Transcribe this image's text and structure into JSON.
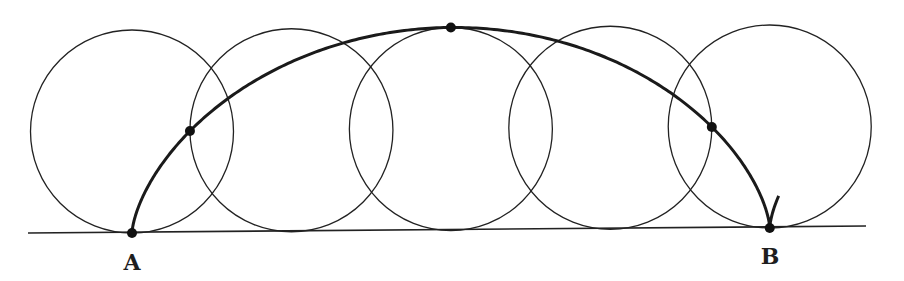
{
  "diagram": {
    "colors": {
      "background": "#ffffff",
      "stroke": "#222222",
      "curve": "#1a1a1a",
      "point": "#111111"
    },
    "ground_line": {
      "x1": 28,
      "y1": 233,
      "x2": 866,
      "y2": 226,
      "stroke_width": 1.6
    },
    "rolling_circle": {
      "radius": 101.5,
      "start_x": 132,
      "base_y": 233,
      "tilt_per_px": -0.00784
    },
    "circles": [
      {
        "t": 0.0
      },
      {
        "t": 1.5708
      },
      {
        "t": 3.1416
      },
      {
        "t": 4.7124
      },
      {
        "t": 6.2832
      }
    ],
    "cycloid": {
      "t_start": 0,
      "t_end": 7.1,
      "stroke_width": 3
    },
    "points": [
      {
        "name": "point-A",
        "t": 0.0,
        "r": 5
      },
      {
        "name": "point-quarter",
        "t": 1.5708,
        "r": 5
      },
      {
        "name": "point-top",
        "t": 3.1416,
        "r": 5
      },
      {
        "name": "point-three-quarter",
        "t": 4.7124,
        "r": 5
      },
      {
        "name": "point-B",
        "t": 6.2832,
        "r": 5
      }
    ],
    "labels": {
      "A": {
        "text": "A",
        "x": 132,
        "y": 270
      },
      "B": {
        "text": "B",
        "x": 770,
        "y": 264
      }
    }
  }
}
